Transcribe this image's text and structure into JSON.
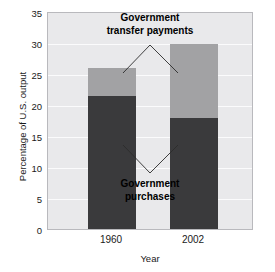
{
  "chart_data": {
    "type": "bar",
    "stacked": true,
    "title": "",
    "xlabel": "Year",
    "ylabel": "Percentage of U.S. output",
    "categories": [
      "1960",
      "2002"
    ],
    "yticks": [
      0,
      5,
      10,
      15,
      20,
      25,
      30,
      35
    ],
    "ylim": [
      0,
      35
    ],
    "grid": true,
    "legend_position": "in-plot annotations",
    "series": [
      {
        "name": "Government purchases",
        "color": "#3a3a3c",
        "values": [
          21.5,
          18.0
        ]
      },
      {
        "name": "Government transfer payments",
        "color": "#a2a2a4",
        "values": [
          4.6,
          12.0
        ]
      }
    ],
    "totals": [
      26.1,
      30.0
    ],
    "annotations": [
      {
        "id": "transfers",
        "line1": "Government",
        "line2": "transfer payments"
      },
      {
        "id": "purchases",
        "line1": "Government",
        "line2": "purchases"
      }
    ]
  },
  "axes": {
    "y_title": "Percentage of U.S. output",
    "x_title": "Year",
    "y_tick_labels": [
      "35",
      "30",
      "25",
      "20",
      "15",
      "10",
      "5",
      "0"
    ],
    "x_tick_labels": [
      "1960",
      "2002"
    ]
  },
  "caption": {
    "text": ""
  },
  "colors": {
    "purchases": "#3a3a3c",
    "transfers": "#a2a2a4",
    "plot_background": "#e9e9eb",
    "gridline": "#fbfbfc",
    "frame": "#b9b9bd"
  }
}
